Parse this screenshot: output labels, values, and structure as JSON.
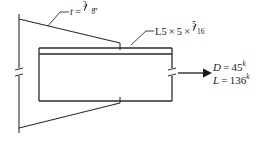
{
  "figure": {
    "line_color": "#2b2b2b",
    "text_color": "#1a1a1a",
    "background": "#ffffff"
  },
  "labels": {
    "thickness": {
      "symbol": "t",
      "equals": "=",
      "fraction_numerator": "3",
      "fraction_denominator": "8",
      "unit": "″",
      "full_text": "t = 3/8″"
    },
    "angle": {
      "designation": "L5",
      "times_1": "×",
      "leg_2": "5",
      "times_2": "×",
      "fraction_numerator": "5",
      "fraction_denominator": "16",
      "full_text": "L5 × 5 × 5/16"
    },
    "loads": {
      "dead": {
        "symbol": "D",
        "equals": "=",
        "value": "45",
        "unit": "k",
        "full_text": "D = 45k"
      },
      "live": {
        "symbol": "L",
        "equals": "=",
        "value": "136",
        "unit": "k",
        "full_text": "L = 136k"
      }
    }
  },
  "icons": {
    "load_arrow": "arrow-right-icon",
    "thickness_leader": "leader-line-icon",
    "angle_leader": "leader-line-icon",
    "break_tick_left": "break-tick-icon",
    "break_tick_right": "break-tick-icon"
  }
}
